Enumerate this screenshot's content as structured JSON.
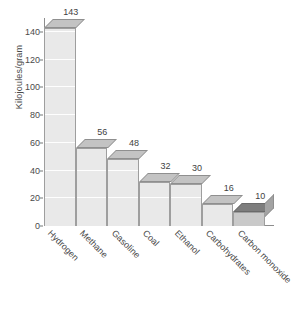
{
  "chart_data": {
    "type": "bar",
    "title": "",
    "subtitle": "",
    "xlabel": "",
    "ylabel": "Kilojoules/gram",
    "categories": [
      "Hydrogen",
      "Methane",
      "Gasoline",
      "Coal",
      "Ethanol",
      "Carbohydrates",
      "Carbon monoxide"
    ],
    "values": [
      143,
      56,
      48,
      32,
      30,
      16,
      10
    ],
    "value_labels": [
      "143",
      "56",
      "48",
      "32",
      "30",
      "16",
      "10"
    ],
    "ylim": [
      0,
      150
    ],
    "yticks": [
      0,
      20,
      40,
      60,
      80,
      100,
      120,
      140
    ],
    "ytick_labels": [
      "0",
      "20",
      "40",
      "60",
      "80",
      "100",
      "120",
      "140"
    ],
    "grid": true,
    "grid_orientation": "horizontal",
    "legend": false,
    "legend_position": "none",
    "style": "3d-bar",
    "bar_colors": [
      "#e9e9e9",
      "#e9e9e9",
      "#e9e9e9",
      "#e9e9e9",
      "#e9e9e9",
      "#e9e9e9",
      "#c9c9c9"
    ],
    "accent_color": "#b3b3b3",
    "axis_color": "#8d8d8d",
    "text_color": "#4a4a4a",
    "background": "#ffffff"
  }
}
